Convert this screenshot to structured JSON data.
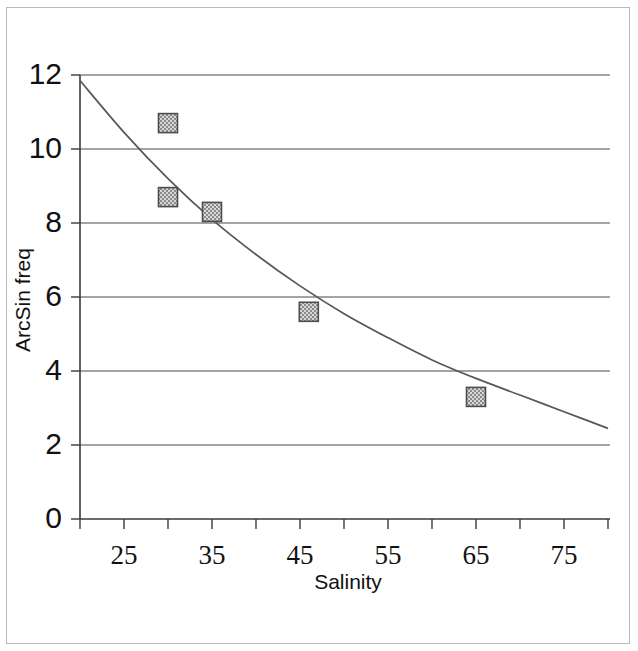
{
  "figure": {
    "alt_title": "Scatter plot of ArcSin transformed frequency versus salinity with fitted decay curve"
  },
  "chart_data": {
    "type": "scatter",
    "title": "",
    "xlabel": "Salinity",
    "ylabel": "ArcSin freq",
    "xlim": [
      20,
      80
    ],
    "ylim": [
      0,
      12
    ],
    "grid": "horizontal",
    "legend": "none",
    "x_ticks": [
      20,
      25,
      30,
      35,
      40,
      45,
      50,
      55,
      60,
      65,
      70,
      75,
      80
    ],
    "x_tick_labels": [
      "",
      "25",
      "",
      "35",
      "",
      "45",
      "",
      "55",
      "",
      "65",
      "",
      "75",
      ""
    ],
    "y_ticks": [
      0,
      2,
      4,
      6,
      8,
      10,
      12
    ],
    "y_tick_labels": [
      "0",
      "2",
      "4",
      "6",
      "8",
      "10",
      "12"
    ],
    "points": [
      {
        "x": 30,
        "y": 10.7
      },
      {
        "x": 30,
        "y": 8.7
      },
      {
        "x": 35,
        "y": 8.3
      },
      {
        "x": 46,
        "y": 5.6
      },
      {
        "x": 65,
        "y": 3.3
      }
    ],
    "series": [
      {
        "name": "ArcSin freq",
        "marker": "filled-square-hatched",
        "x": [
          30,
          30,
          35,
          46,
          65
        ],
        "values": [
          10.7,
          8.7,
          8.3,
          5.6,
          3.3
        ]
      },
      {
        "name": "fitted curve",
        "type": "line",
        "x": [
          20,
          25,
          30,
          35,
          40,
          45,
          50,
          55,
          60,
          65,
          70,
          75,
          80
        ],
        "values": [
          11.85,
          10.45,
          9.2,
          8.1,
          7.15,
          6.3,
          5.55,
          4.9,
          4.3,
          3.8,
          3.35,
          2.9,
          2.45
        ]
      }
    ],
    "colors": {
      "marker_fill": "#9a9a9a",
      "marker_edge": "#4d4d4d",
      "curve": "#575757",
      "grid": "#4a4a4a",
      "axis": "#3a3a3a",
      "text": "#111111",
      "background": "#ffffff"
    }
  }
}
